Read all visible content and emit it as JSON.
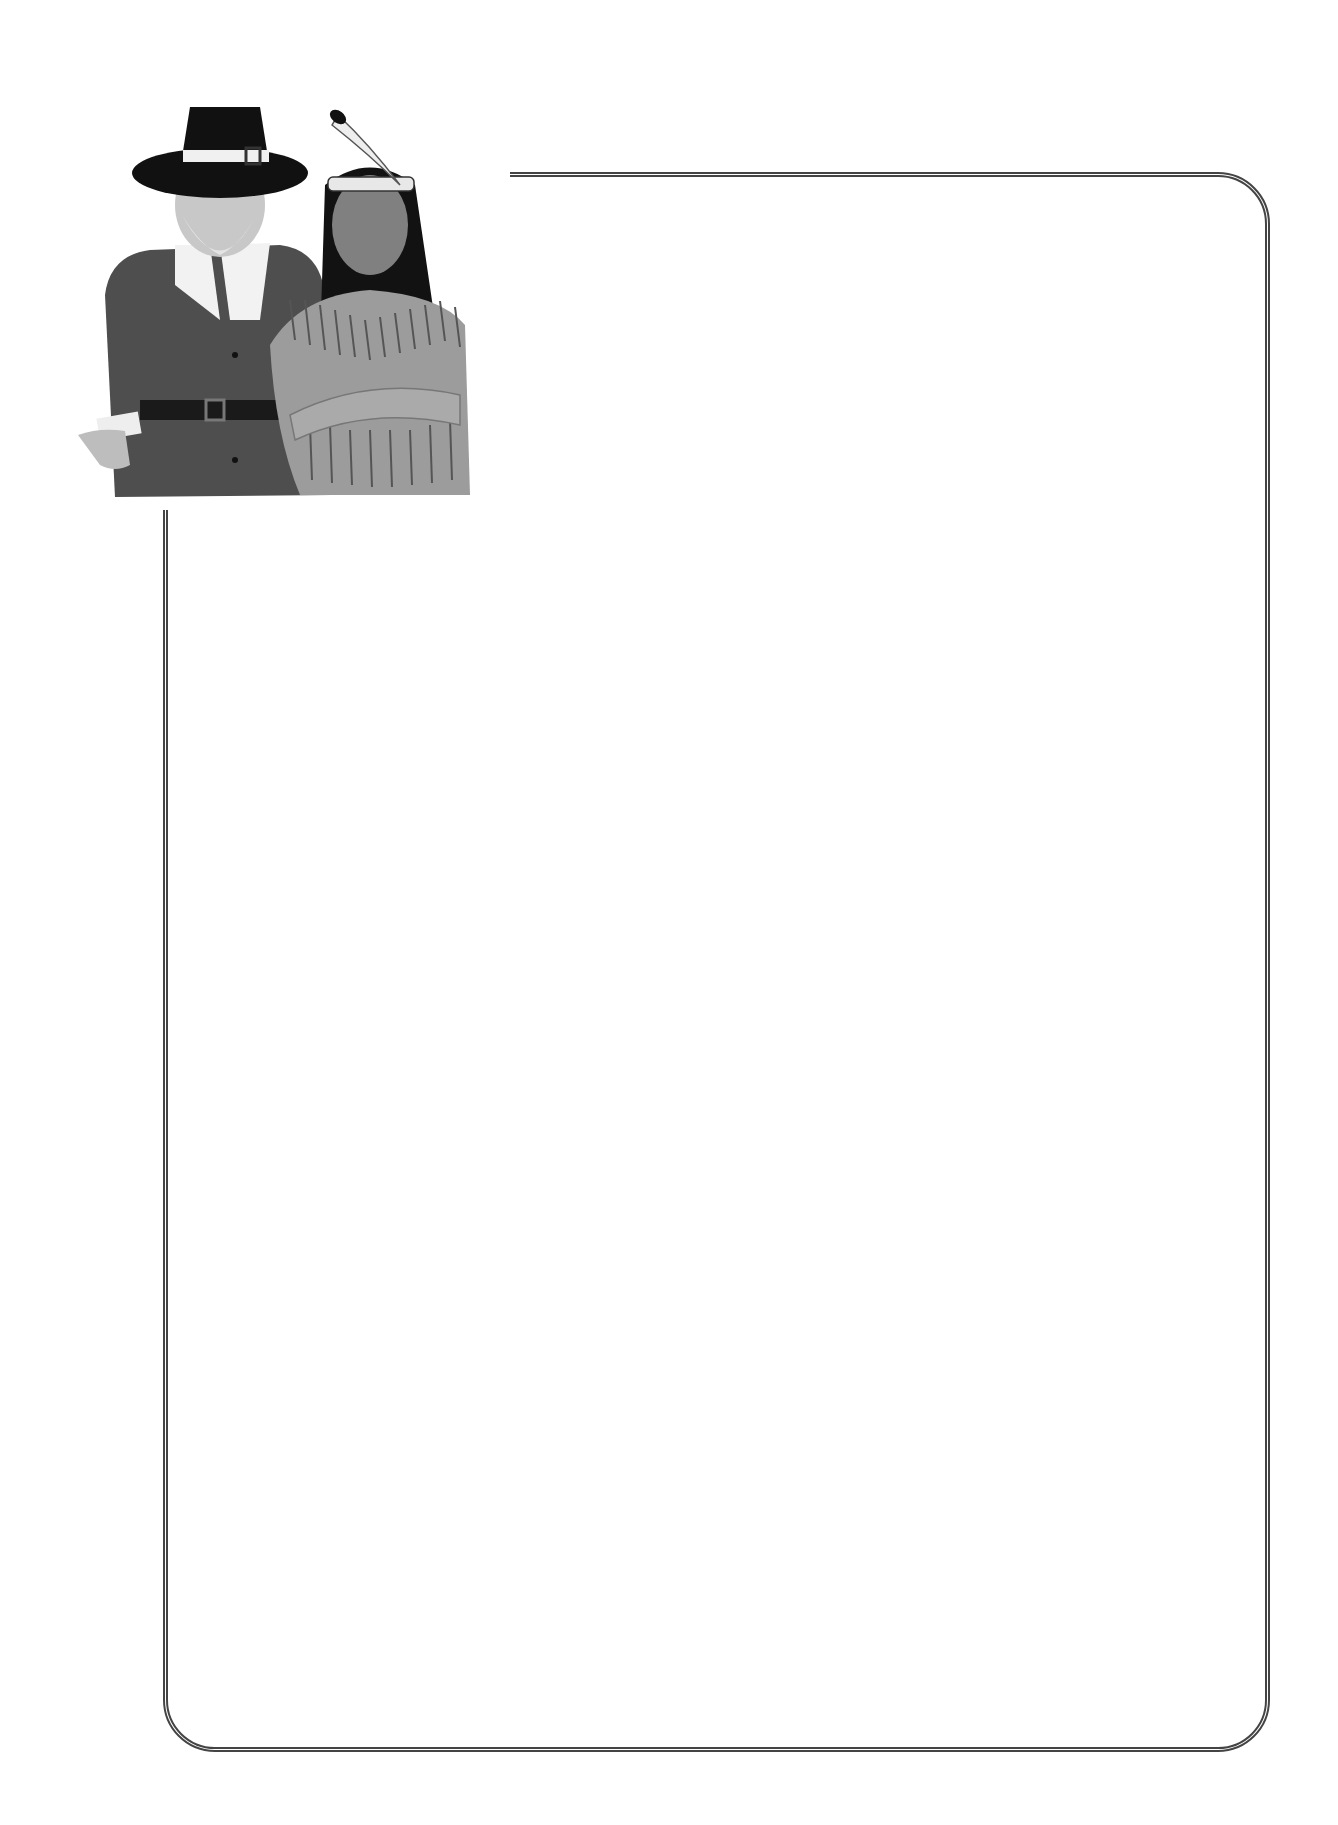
{
  "page": {
    "type": "blank stationery border template",
    "background_color": "#ffffff",
    "border_color": "#444444"
  },
  "illustration": {
    "subject": "pilgrim and native american",
    "figures": [
      "pilgrim-man",
      "native-american-man"
    ]
  },
  "content_area": {
    "text": ""
  }
}
